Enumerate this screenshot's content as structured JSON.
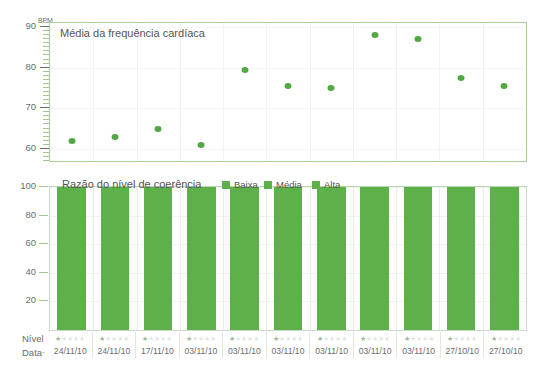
{
  "scatter": {
    "title": "Média da frequência cardíaca",
    "unit": "BPM",
    "y_ticks": [
      "90",
      "80",
      "70",
      "60"
    ],
    "accent_color": "#54a745"
  },
  "bars": {
    "title": "Razão do nível de coerência",
    "y_ticks": [
      "100",
      "80",
      "60",
      "40",
      "20"
    ],
    "legend": [
      {
        "label": "Baixa",
        "color": "#5eb04a"
      },
      {
        "label": "Média",
        "color": "#5eb04a"
      },
      {
        "label": "Alta",
        "color": "#5eb04a"
      }
    ]
  },
  "table": {
    "nivel_label": "Nível",
    "data_label": "Data",
    "data_prefix": "-",
    "dates": [
      "24/11/10",
      "24/11/10",
      "17/11/10",
      "03/11/10",
      "03/11/10",
      "03/11/10",
      "03/11/10",
      "03/11/10",
      "03/11/10",
      "27/10/10",
      "27/10/10"
    ],
    "stars_max": 5,
    "stars_filled": [
      1,
      1,
      1,
      1,
      1,
      1,
      1,
      1,
      1,
      1,
      1
    ]
  },
  "chart_data": [
    {
      "type": "scatter",
      "title": "Média da frequência cardíaca",
      "xlabel": "",
      "ylabel": "BPM",
      "ylim": [
        57,
        91
      ],
      "yticks": [
        60,
        70,
        80,
        90
      ],
      "grid": true,
      "categories": [
        "24/11/10",
        "24/11/10",
        "17/11/10",
        "03/11/10",
        "03/11/10",
        "03/11/10",
        "03/11/10",
        "03/11/10",
        "03/11/10",
        "27/10/10",
        "27/10/10"
      ],
      "values": [
        62,
        63,
        65,
        61,
        79.5,
        75.5,
        75,
        88,
        87,
        77.5,
        75.5
      ],
      "marker_color": "#54a745"
    },
    {
      "type": "bar",
      "subtype": "stacked-100",
      "title": "Razão do nível de coerência",
      "xlabel": "Data",
      "ylabel": "",
      "ylim": [
        0,
        100
      ],
      "yticks": [
        20,
        40,
        60,
        80,
        100
      ],
      "grid": true,
      "legend_position": "top-right",
      "categories": [
        "24/11/10",
        "24/11/10",
        "17/11/10",
        "03/11/10",
        "03/11/10",
        "03/11/10",
        "03/11/10",
        "03/11/10",
        "03/11/10",
        "27/10/10",
        "27/10/10"
      ],
      "series": [
        {
          "name": "Baixa",
          "color": "#5eb04a",
          "values": [
            4,
            43,
            55,
            61,
            72,
            78,
            73,
            72,
            61,
            68,
            47
          ]
        },
        {
          "name": "Média",
          "color": "#5eb04a",
          "values": [
            5,
            20,
            20,
            26,
            16,
            18,
            8,
            19,
            30,
            9,
            27
          ]
        },
        {
          "name": "Alta",
          "color": "#5eb04a",
          "values": [
            91,
            37,
            25,
            13,
            12,
            4,
            19,
            9,
            9,
            23,
            26
          ]
        }
      ]
    }
  ]
}
